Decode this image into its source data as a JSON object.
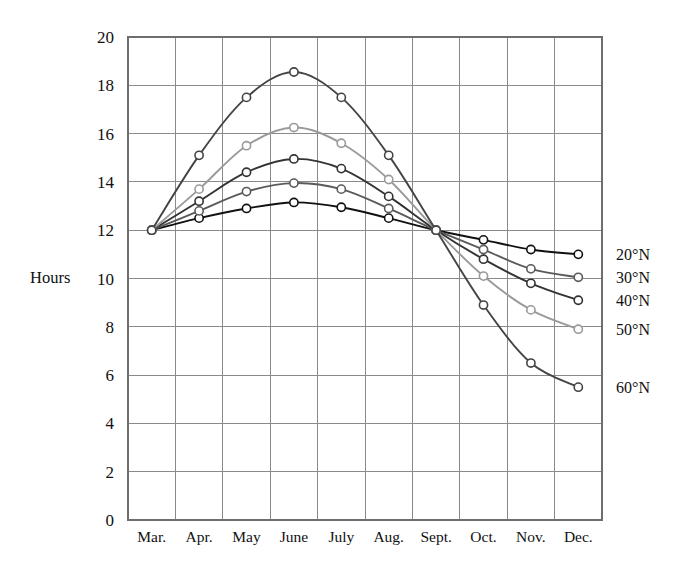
{
  "axis": {
    "y_title": "Hours",
    "y_ticks": [
      "0",
      "2",
      "4",
      "6",
      "8",
      "10",
      "12",
      "14",
      "16",
      "18",
      "20"
    ],
    "x_ticks": [
      "Mar.",
      "Apr.",
      "May",
      "June",
      "July",
      "Aug.",
      "Sept.",
      "Oct.",
      "Nov.",
      "Dec."
    ]
  },
  "legend": {
    "items": [
      {
        "label": "20°N",
        "color": "#111111"
      },
      {
        "label": "30°N",
        "color": "#5a5a5a"
      },
      {
        "label": "40°N",
        "color": "#333333"
      },
      {
        "label": "50°N",
        "color": "#9a9a9a"
      },
      {
        "label": "60°N",
        "color": "#444444"
      }
    ]
  },
  "chart_data": {
    "type": "line",
    "title": "",
    "xlabel": "",
    "ylabel": "Hours",
    "ylim": [
      0,
      20
    ],
    "ytick_step": 2,
    "grid": true,
    "legend_position": "right",
    "categories": [
      "Mar.",
      "Apr.",
      "May",
      "June",
      "July",
      "Aug.",
      "Sept.",
      "Oct.",
      "Nov.",
      "Dec."
    ],
    "series": [
      {
        "name": "20°N",
        "color": "#111111",
        "values": [
          12.0,
          12.5,
          12.9,
          13.15,
          12.95,
          12.5,
          12.0,
          11.6,
          11.2,
          11.0
        ]
      },
      {
        "name": "30°N",
        "color": "#5a5a5a",
        "values": [
          12.0,
          12.8,
          13.6,
          13.95,
          13.7,
          12.9,
          12.0,
          11.2,
          10.4,
          10.05
        ]
      },
      {
        "name": "40°N",
        "color": "#333333",
        "values": [
          12.0,
          13.2,
          14.4,
          14.95,
          14.55,
          13.4,
          12.0,
          10.8,
          9.8,
          9.1
        ]
      },
      {
        "name": "50°N",
        "color": "#9a9a9a",
        "values": [
          12.0,
          13.7,
          15.5,
          16.25,
          15.6,
          14.1,
          12.0,
          10.1,
          8.7,
          7.9
        ]
      },
      {
        "name": "60°N",
        "color": "#444444",
        "values": [
          12.0,
          15.1,
          17.5,
          18.55,
          17.5,
          15.1,
          12.0,
          8.9,
          6.5,
          5.5
        ]
      }
    ]
  }
}
